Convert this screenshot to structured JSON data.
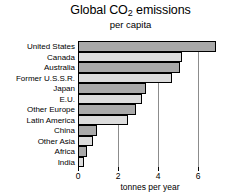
{
  "chart_data": {
    "type": "bar",
    "orientation": "horizontal",
    "title": "Global CO2 emissions",
    "title_main": "Global CO",
    "title_sub": "2",
    "title_tail": " emissions",
    "subtitle": "per capita",
    "xlabel": "tonnes per year",
    "ylabel": "",
    "xlim": [
      0,
      7.2
    ],
    "xticks": [
      0,
      2,
      4,
      6
    ],
    "xtick_labels": [
      "0",
      "2",
      "4",
      "6"
    ],
    "grid": true,
    "legend": "none",
    "categories": [
      "United States",
      "Canada",
      "Australia",
      "Former U.S.S.R.",
      "Japan",
      "E.U.",
      "Other Europe",
      "Latin America",
      "China",
      "Other Asia",
      "Africa",
      "India"
    ],
    "values": [
      6.9,
      5.2,
      5.1,
      4.7,
      3.4,
      3.2,
      2.9,
      2.5,
      0.95,
      0.75,
      0.45,
      0.3
    ],
    "bar_shades": [
      "dark",
      "light",
      "dark",
      "light",
      "dark",
      "light",
      "dark",
      "light",
      "dark",
      "light",
      "dark",
      "light"
    ],
    "colors": {
      "bar_dark": "#a9a9a9",
      "bar_light": "#dcdcdc",
      "bar_outline": "#000000",
      "gridline": "#8c8c8c",
      "axis": "#000000",
      "background": "#ffffff",
      "text": "#000000"
    }
  }
}
